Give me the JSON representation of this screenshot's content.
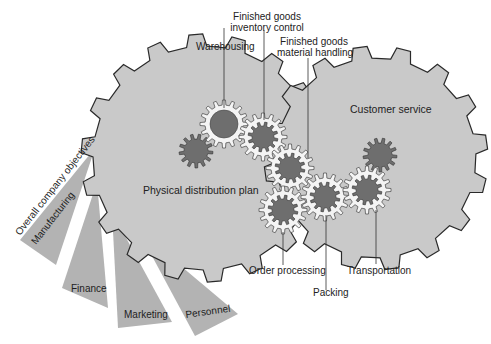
{
  "diagram": {
    "type": "gear-metaphor-diagram",
    "big_gears": [
      {
        "id": "physical-distribution-plan",
        "label": "Physical distribution plan",
        "fill": "#c9c9c9"
      },
      {
        "id": "customer-service",
        "label": "Customer service",
        "fill": "#c9c9c9"
      }
    ],
    "component_labels": {
      "warehousing": "Warehousing",
      "inventory_control_line1": "Finished goods",
      "inventory_control_line2": "inventory control",
      "material_handling_line1": "Finished goods",
      "material_handling_line2": "material handling",
      "order_processing": "Order processing",
      "packing": "Packing",
      "transportation": "Transportation"
    },
    "fan": {
      "header": "Overall company objectives",
      "items": [
        "Manufacturing",
        "Finance",
        "Marketing",
        "Personnel"
      ],
      "fill": "#b3b3b3"
    },
    "colors": {
      "big_gear_fill": "#c9c9c9",
      "small_gear_dark": "#6e6e6e",
      "small_gear_ring": "#f4f4f4",
      "outline": "#2a2a2a",
      "background": "#ffffff"
    }
  }
}
